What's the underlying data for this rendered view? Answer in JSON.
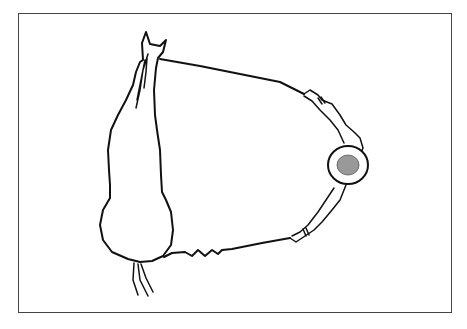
{
  "diagram": {
    "colors": {
      "stroke": "#111111",
      "frame": "#444444",
      "head_fill": "#999999",
      "background": "#ffffff"
    },
    "elements": [
      "horse",
      "upper-line",
      "lower-line",
      "handler"
    ]
  }
}
